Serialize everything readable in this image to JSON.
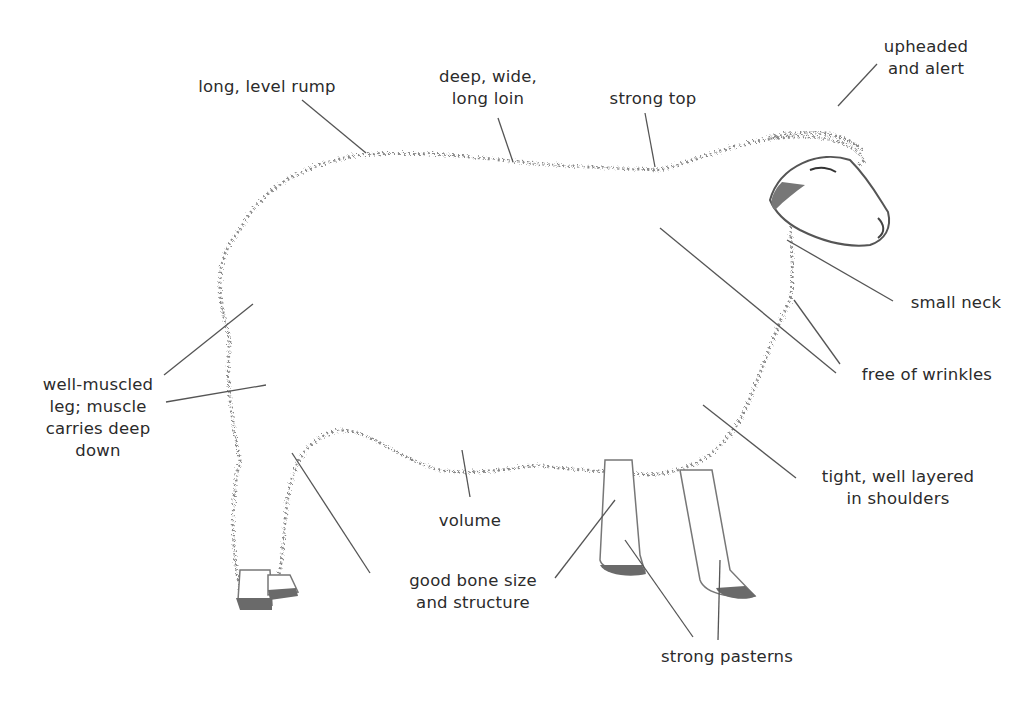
{
  "diagram": {
    "labels": [
      {
        "id": "long-level-rump",
        "text": "long, level rump",
        "x": 162,
        "y": 76,
        "w": 210
      },
      {
        "id": "deep-wide-long-loin",
        "text": "deep, wide,\nlong loin",
        "x": 418,
        "y": 68,
        "w": 140
      },
      {
        "id": "strong-top",
        "text": "strong top",
        "x": 598,
        "y": 90,
        "w": 110
      },
      {
        "id": "upheaded-and-alert",
        "text": "upheaded\nand alert",
        "x": 866,
        "y": 38,
        "w": 120
      },
      {
        "id": "small-neck",
        "text": "small neck",
        "x": 886,
        "y": 292,
        "w": 120
      },
      {
        "id": "free-of-wrinkles",
        "text": "free of wrinkles",
        "x": 842,
        "y": 364,
        "w": 170
      },
      {
        "id": "tight-well-layered-in-shoulders",
        "text": "tight, well layered\nin shoulders",
        "x": 792,
        "y": 466,
        "w": 200
      },
      {
        "id": "well-muscled-leg",
        "text": "well-muscled\nleg; muscle\ncarries deep\ndown",
        "x": 28,
        "y": 374,
        "w": 140
      },
      {
        "id": "volume",
        "text": "volume",
        "x": 425,
        "y": 510,
        "w": 90
      },
      {
        "id": "good-bone-size-and-structure",
        "text": "good bone size\nand structure",
        "x": 388,
        "y": 570,
        "w": 170
      },
      {
        "id": "strong-pasterns",
        "text": "strong pasterns",
        "x": 642,
        "y": 646,
        "w": 170
      }
    ],
    "leader_color": "#555555",
    "wool_color": "#7a7a7a"
  }
}
